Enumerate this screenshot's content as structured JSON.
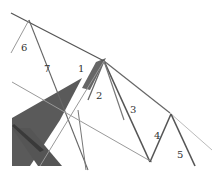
{
  "diagram": {
    "labels": [
      {
        "id": "1",
        "text": "1",
        "x": 78,
        "y": 72
      },
      {
        "id": "2",
        "text": "2",
        "x": 96,
        "y": 97
      },
      {
        "id": "3",
        "text": "3",
        "x": 130,
        "y": 112
      },
      {
        "id": "4",
        "text": "4",
        "x": 154,
        "y": 138
      },
      {
        "id": "5",
        "text": "5",
        "x": 177,
        "y": 157
      },
      {
        "id": "6",
        "text": "6",
        "x": 21,
        "y": 51
      },
      {
        "id": "7",
        "text": "7",
        "x": 44,
        "y": 72
      }
    ],
    "colors": {
      "line": "#555555",
      "fill_dark": "#5a5a5a",
      "fill_darker": "#444444",
      "light_line": "#9a9a9a"
    }
  }
}
